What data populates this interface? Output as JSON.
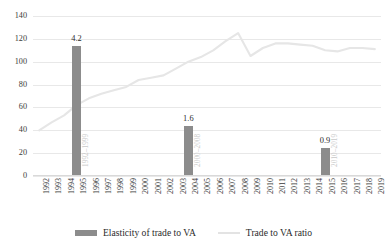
{
  "chart_data": {
    "type": "bar",
    "title": "",
    "xlabel": "",
    "ylabel": "",
    "ylim": [
      0,
      140
    ],
    "yticks": [
      0,
      20,
      40,
      60,
      80,
      100,
      120,
      140
    ],
    "grid": true,
    "legend_position": "bottom",
    "categories": [
      "1992",
      "1993",
      "1994",
      "1995",
      "1996",
      "1997",
      "1998",
      "1999",
      "2000",
      "2001",
      "2002",
      "2003",
      "2004",
      "2005",
      "2006",
      "2007",
      "2008",
      "2009",
      "2010",
      "2011",
      "2012",
      "2013",
      "2014",
      "2015",
      "2016",
      "2017",
      "2018",
      "2019"
    ],
    "series": [
      {
        "name": "Elasticity of trade to VA",
        "type": "bar",
        "color": "#8c8c8c",
        "axis": "secondary",
        "points": [
          {
            "category": "1995",
            "value": 4.2,
            "label": "4.2",
            "period": "1992–1999",
            "plotted_height": 130
          },
          {
            "category": "2004",
            "value": 1.6,
            "label": "1.6",
            "period": "2000–2008",
            "plotted_height": 50
          },
          {
            "category": "2015",
            "value": 0.9,
            "label": "0.9",
            "period": "2010–2019",
            "plotted_height": 28
          }
        ]
      },
      {
        "name": "Trade to VA ratio",
        "type": "line",
        "color": "#e3e3e3",
        "axis": "primary",
        "values": [
          40,
          47,
          53,
          62,
          68,
          72,
          75,
          78,
          84,
          86,
          88,
          94,
          100,
          104,
          110,
          118,
          125,
          105,
          112,
          116,
          116,
          115,
          114,
          110,
          109,
          112,
          112,
          111
        ]
      }
    ]
  },
  "legend": {
    "items": [
      {
        "label": "Elasticity of trade to VA",
        "marker": "bar-swatch"
      },
      {
        "label": "Trade to VA ratio",
        "marker": "line-swatch"
      }
    ]
  }
}
